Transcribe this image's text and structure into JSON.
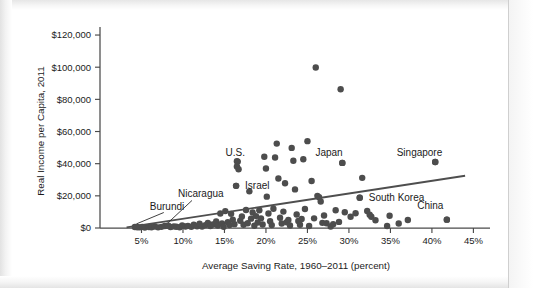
{
  "chart_data": {
    "type": "scatter",
    "title": "",
    "xlabel": "Average Saving Rate, 1960–2011 (percent)",
    "ylabel": "Real Income per Capita, 2011",
    "xlim": [
      0,
      47
    ],
    "ylim": [
      0,
      125000
    ],
    "grid": false,
    "legend": "none",
    "x_ticks": [
      5,
      10,
      15,
      20,
      25,
      30,
      35,
      40,
      45
    ],
    "x_tick_labels": [
      "5%",
      "10%",
      "15%",
      "20%",
      "25%",
      "30%",
      "35%",
      "40%",
      "45%"
    ],
    "y_ticks": [
      0,
      20000,
      40000,
      60000,
      80000,
      100000,
      120000
    ],
    "y_tick_labels": [
      "$0",
      "$20,000",
      "$40,000",
      "$60,000",
      "$80,000",
      "$100,000",
      "$120,000"
    ],
    "marker_color": "#4d4d4d",
    "marker_size_px": 5.2,
    "trend_line": {
      "color": "#4e4e4e",
      "x_start": 3.2,
      "y_start": 400,
      "x_end": 44.0,
      "y_end": 32500
    },
    "annotations": [
      {
        "text": "Burundi",
        "label_x": 6.0,
        "label_y": 11500,
        "point_x": 4.4,
        "point_y": 700,
        "leader": true
      },
      {
        "text": "Nicaragua",
        "label_x": 9.4,
        "label_y": 19000,
        "point_x": 8.2,
        "point_y": 1400,
        "leader": true
      },
      {
        "text": "Israel",
        "label_x": 14.0,
        "label_y": 26200,
        "point_x": 16.4,
        "point_y": 26200,
        "leader": false
      },
      {
        "text": "U.S.",
        "label_x": 16.3,
        "label_y": 45000,
        "point_x": 16.5,
        "point_y": 41500,
        "leader": false
      },
      {
        "text": "Japan",
        "label_x": 27.6,
        "label_y": 45000,
        "point_x": 29.2,
        "point_y": 40500,
        "leader": false
      },
      {
        "text": "Singapore",
        "label_x": 38.5,
        "label_y": 45000,
        "point_x": 40.4,
        "point_y": 41000,
        "leader": false
      },
      {
        "text": "South Korea",
        "label_x": 31.5,
        "label_y": 18500,
        "point_x": 31.3,
        "point_y": 18800,
        "leader": false
      },
      {
        "text": "China",
        "label_x": 39.8,
        "label_y": 12000,
        "point_x": 41.8,
        "point_y": 5200,
        "leader": false
      }
    ],
    "points": [
      [
        4.2,
        600
      ],
      [
        4.5,
        500
      ],
      [
        4.8,
        400
      ],
      [
        5.1,
        700
      ],
      [
        5.4,
        300
      ],
      [
        5.9,
        600
      ],
      [
        6.2,
        500
      ],
      [
        6.6,
        900
      ],
      [
        7.0,
        400
      ],
      [
        7.4,
        700
      ],
      [
        7.8,
        1200
      ],
      [
        8.2,
        1400
      ],
      [
        8.5,
        600
      ],
      [
        8.9,
        1000
      ],
      [
        9.2,
        800
      ],
      [
        9.6,
        500
      ],
      [
        9.9,
        1600
      ],
      [
        10.3,
        900
      ],
      [
        10.6,
        1300
      ],
      [
        11.0,
        700
      ],
      [
        11.3,
        2000
      ],
      [
        11.7,
        1100
      ],
      [
        12.0,
        2600
      ],
      [
        12.3,
        900
      ],
      [
        12.7,
        1800
      ],
      [
        13.0,
        3200
      ],
      [
        13.3,
        1200
      ],
      [
        13.6,
        2200
      ],
      [
        14.0,
        4000
      ],
      [
        14.2,
        1500
      ],
      [
        14.5,
        9000
      ],
      [
        14.7,
        2800
      ],
      [
        14.9,
        700
      ],
      [
        15.1,
        10500
      ],
      [
        15.4,
        3600
      ],
      [
        15.6,
        1900
      ],
      [
        15.8,
        8800
      ],
      [
        16.0,
        5200
      ],
      [
        16.2,
        2400
      ],
      [
        16.4,
        26200
      ],
      [
        16.5,
        38200
      ],
      [
        16.6,
        41300
      ],
      [
        16.7,
        36500
      ],
      [
        16.9,
        4500
      ],
      [
        17.1,
        7200
      ],
      [
        17.3,
        2000
      ],
      [
        17.6,
        11200
      ],
      [
        17.8,
        3000
      ],
      [
        18.0,
        22800
      ],
      [
        18.2,
        5800
      ],
      [
        18.4,
        9600
      ],
      [
        18.6,
        1400
      ],
      [
        18.8,
        7400
      ],
      [
        19.0,
        3400
      ],
      [
        19.2,
        11000
      ],
      [
        19.4,
        6000
      ],
      [
        19.6,
        2200
      ],
      [
        19.8,
        44300
      ],
      [
        20.0,
        37000
      ],
      [
        20.1,
        19500
      ],
      [
        20.3,
        9000
      ],
      [
        20.5,
        4200
      ],
      [
        20.7,
        1800
      ],
      [
        20.9,
        12000
      ],
      [
        21.1,
        43800
      ],
      [
        21.3,
        52500
      ],
      [
        21.5,
        30800
      ],
      [
        21.7,
        6400
      ],
      [
        21.9,
        2800
      ],
      [
        22.1,
        10200
      ],
      [
        22.3,
        27800
      ],
      [
        22.5,
        3600
      ],
      [
        22.7,
        5000
      ],
      [
        22.9,
        1600
      ],
      [
        23.1,
        49800
      ],
      [
        23.3,
        41800
      ],
      [
        23.5,
        24000
      ],
      [
        23.7,
        8400
      ],
      [
        23.9,
        4400
      ],
      [
        24.1,
        2000
      ],
      [
        24.3,
        5600
      ],
      [
        24.5,
        42800
      ],
      [
        24.7,
        11800
      ],
      [
        25.0,
        54000
      ],
      [
        25.2,
        1200
      ],
      [
        25.5,
        29200
      ],
      [
        25.8,
        6000
      ],
      [
        26.0,
        99800
      ],
      [
        26.2,
        20000
      ],
      [
        26.4,
        19200
      ],
      [
        26.6,
        16500
      ],
      [
        26.8,
        3200
      ],
      [
        27.0,
        7800
      ],
      [
        27.3,
        3000
      ],
      [
        27.8,
        900
      ],
      [
        28.1,
        2400
      ],
      [
        28.4,
        11000
      ],
      [
        28.8,
        3800
      ],
      [
        29.0,
        86300
      ],
      [
        29.2,
        40500
      ],
      [
        29.5,
        9800
      ],
      [
        30.2,
        7000
      ],
      [
        30.8,
        9200
      ],
      [
        31.3,
        18800
      ],
      [
        31.6,
        31200
      ],
      [
        32.2,
        10600
      ],
      [
        32.5,
        8200
      ],
      [
        32.7,
        7000
      ],
      [
        33.2,
        4800
      ],
      [
        34.6,
        1200
      ],
      [
        34.9,
        7600
      ],
      [
        36.0,
        2800
      ],
      [
        37.1,
        5000
      ],
      [
        40.4,
        41000
      ],
      [
        41.8,
        5200
      ]
    ]
  }
}
